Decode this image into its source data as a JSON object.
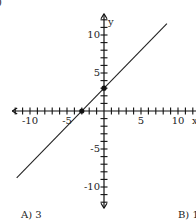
{
  "chart_data": {
    "type": "line",
    "title": "",
    "xlabel": "x",
    "ylabel": "y",
    "xlim": [
      -12,
      12
    ],
    "ylim": [
      -12,
      12
    ],
    "grid": false,
    "x_tick_labels": [
      "-10",
      "-5",
      "5",
      "10"
    ],
    "y_tick_labels": [
      "10",
      "5",
      "-5",
      "-10"
    ],
    "tick_step": 1,
    "series": [
      {
        "name": "line",
        "equation": "y = x + 3",
        "x": [
          -11.8,
          8.5
        ],
        "y": [
          -8.8,
          11.5
        ]
      }
    ],
    "marked_points": [
      {
        "x": -3,
        "y": 0,
        "label": "x-intercept"
      },
      {
        "x": 0,
        "y": 3,
        "label": "y-intercept"
      }
    ]
  },
  "page": {
    "corner_mark": ")",
    "choices": {
      "a": "A) 3",
      "b": "B) 1"
    }
  },
  "axes": {
    "x_label": "x",
    "y_label": "y",
    "x_ticks": {
      "neg10": "-10",
      "neg5": "-5",
      "pos5": "5",
      "pos10": "10"
    },
    "y_ticks": {
      "pos10": "10",
      "pos5": "5",
      "neg5": "-5",
      "neg10": "-10"
    }
  },
  "colors": {
    "axis": "#111111",
    "line": "#222222",
    "background": "#ffffff"
  }
}
